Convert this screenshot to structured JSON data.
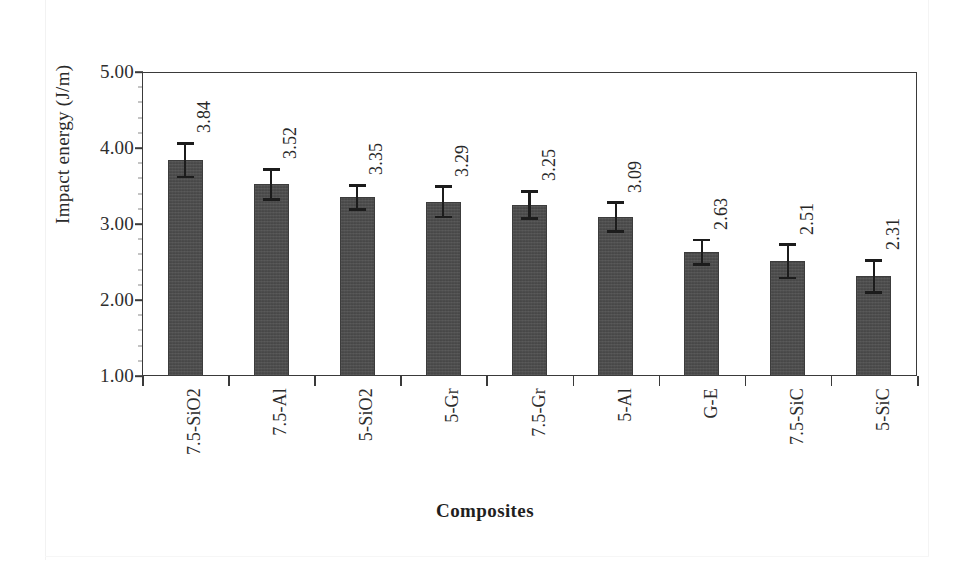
{
  "chart_data": {
    "type": "bar",
    "title": "",
    "xlabel": "Composites",
    "ylabel": "Impact energy (J/m)",
    "ylim": [
      1.0,
      5.0
    ],
    "ytick_labels": [
      "5.00",
      "4.00",
      "3.00",
      "2.00",
      "1.00"
    ],
    "ytick_values": [
      5.0,
      4.0,
      3.0,
      2.0,
      1.0
    ],
    "grid": false,
    "legend": "none",
    "categories": [
      "7.5-SiO2",
      "7.5-Al",
      "5-SiO2",
      "5-Gr",
      "7.5-Gr",
      "5-Al",
      "G-E",
      "7.5-SiC",
      "5-SiC"
    ],
    "values": [
      3.84,
      3.52,
      3.35,
      3.29,
      3.25,
      3.09,
      2.63,
      2.51,
      2.31
    ],
    "value_labels": [
      "3.84",
      "3.52",
      "3.35",
      "3.29",
      "3.25",
      "3.09",
      "2.63",
      "2.51",
      "2.31"
    ],
    "errors": [
      0.22,
      0.2,
      0.16,
      0.2,
      0.18,
      0.19,
      0.16,
      0.22,
      0.21
    ],
    "bar_color": "#4b4b4b",
    "axis_color": "#3a3a3a",
    "error_bar_color": "#1c1c1c"
  },
  "figure": {
    "caption": ""
  }
}
